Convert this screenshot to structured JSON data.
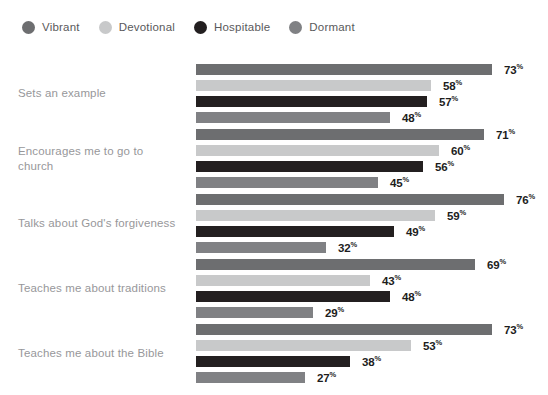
{
  "legend": {
    "items": [
      {
        "label": "Vibrant",
        "color": "#6d6e70"
      },
      {
        "label": "Devotional",
        "color": "#c8c9ca"
      },
      {
        "label": "Hospitable",
        "color": "#231f20"
      },
      {
        "label": "Dormant",
        "color": "#808184"
      }
    ]
  },
  "chart_data": {
    "type": "bar",
    "orientation": "horizontal",
    "title": "",
    "subtitle": "",
    "xlabel": "",
    "ylabel": "",
    "xlim": [
      0,
      80
    ],
    "grid": false,
    "legend_position": "top-left",
    "value_suffix": "%",
    "categories": [
      "Sets an example",
      "Encourages me to go to church",
      "Talks about God's forgiveness",
      "Teaches me about traditions",
      "Teaches me about the Bible"
    ],
    "series": [
      {
        "name": "Vibrant",
        "color": "#6d6e70",
        "values": [
          73,
          71,
          76,
          69,
          73
        ]
      },
      {
        "name": "Devotional",
        "color": "#c8c9ca",
        "values": [
          58,
          60,
          59,
          43,
          53
        ]
      },
      {
        "name": "Hospitable",
        "color": "#231f20",
        "values": [
          57,
          56,
          49,
          48,
          38
        ]
      },
      {
        "name": "Dormant",
        "color": "#808184",
        "values": [
          48,
          45,
          32,
          29,
          27
        ]
      }
    ],
    "value_labels": [
      [
        "73%",
        "58%",
        "57%",
        "48%"
      ],
      [
        "71%",
        "60%",
        "56%",
        "45%"
      ],
      [
        "76%",
        "59%",
        "49%",
        "32%"
      ],
      [
        "69%",
        "43%",
        "48%",
        "29%"
      ],
      [
        "73%",
        "53%",
        "38%",
        "27%"
      ]
    ]
  },
  "category_label_lines": [
    [
      "Sets an example"
    ],
    [
      "Encourages me to go to",
      "church"
    ],
    [
      "Talks about God's forgiveness"
    ],
    [
      "Teaches me about traditions"
    ],
    [
      "Teaches me about the Bible"
    ]
  ]
}
